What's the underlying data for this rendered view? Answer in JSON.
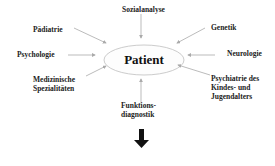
{
  "center": {
    "label": "Patient"
  },
  "nodes": [
    {
      "id": "sozialanalyse",
      "label": "Sozialanalyse"
    },
    {
      "id": "paediatrie",
      "label": "Pädiatrie"
    },
    {
      "id": "genetik",
      "label": "Genetik"
    },
    {
      "id": "psychologie",
      "label": "Psychologie"
    },
    {
      "id": "neurologie",
      "label": "Neurologie"
    },
    {
      "id": "medizinische",
      "label_line1": "Medizinische",
      "label_line2": "Spezialitäten"
    },
    {
      "id": "psychiatrie",
      "label_line1": "Psychiatrie des",
      "label_line2": "Kindes- und",
      "label_line3": "Jugendalters"
    },
    {
      "id": "funktionsdiagnostik",
      "label_line1": "Funktions-",
      "label_line2": "diagnostik"
    }
  ],
  "colors": {
    "arrow": "#aaaaaa",
    "ellipse": "#cccccc",
    "text": "#222222",
    "down_arrow": "#111111"
  }
}
